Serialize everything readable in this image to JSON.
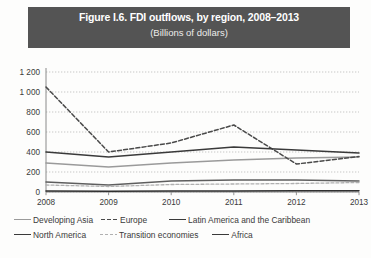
{
  "title": {
    "main": "Figure I.6. FDI outflows, by region, 2008–2013",
    "sub": "(Billions of dollars)"
  },
  "colors": {
    "banner_bg": "#545454",
    "banner_text": "#ffffff",
    "grid": "#b9b9b9",
    "axis": "#8a8a8a",
    "developing_asia": "#9a9a9a",
    "europe": "#4a4a4a",
    "latin_america": "#3a3a3a",
    "north_america": "#5e5e5e",
    "transition_economies": "#b0b0b0",
    "africa": "#2f2f2f"
  },
  "axes": {
    "y_ticks": [
      "0",
      "200",
      "400",
      "600",
      "800",
      "1 000",
      "1 200"
    ],
    "y_min": 0,
    "y_max": 1200,
    "x_ticks": [
      "2008",
      "2009",
      "2010",
      "2011",
      "2012",
      "2013"
    ]
  },
  "legend": {
    "rows": [
      [
        {
          "label": "Developing Asia",
          "style": "solid-gray"
        },
        {
          "label": "Europe",
          "style": "dashed-dark"
        },
        {
          "label": "Latin America and the Caribbean",
          "style": "solid-dark"
        }
      ],
      [
        {
          "label": "North America",
          "style": "solid-dark"
        },
        {
          "label": "Transition economies",
          "style": "dashed-light"
        },
        {
          "label": "Africa",
          "style": "solid-dark"
        }
      ]
    ]
  },
  "chart_data": {
    "type": "line",
    "title": "Figure I.6. FDI outflows, by region, 2008–2013",
    "subtitle": "(Billions of dollars)",
    "xlabel": "",
    "ylabel": "Billions of dollars",
    "categories": [
      "2008",
      "2009",
      "2010",
      "2011",
      "2012",
      "2013"
    ],
    "ylim": [
      0,
      1200
    ],
    "ytick_step": 200,
    "grid": true,
    "legend_position": "bottom",
    "series": [
      {
        "name": "Developing Asia",
        "values": [
          290,
          250,
          290,
          320,
          340,
          350
        ]
      },
      {
        "name": "Europe",
        "values": [
          1050,
          400,
          490,
          670,
          280,
          355
        ]
      },
      {
        "name": "Latin America and the Caribbean",
        "values": [
          400,
          350,
          400,
          450,
          420,
          390
        ]
      },
      {
        "name": "North America",
        "values": [
          100,
          70,
          110,
          120,
          120,
          110
        ]
      },
      {
        "name": "Transition economies",
        "values": [
          70,
          55,
          75,
          80,
          85,
          95
        ]
      },
      {
        "name": "Africa",
        "values": [
          10,
          8,
          10,
          11,
          12,
          12
        ]
      }
    ]
  }
}
